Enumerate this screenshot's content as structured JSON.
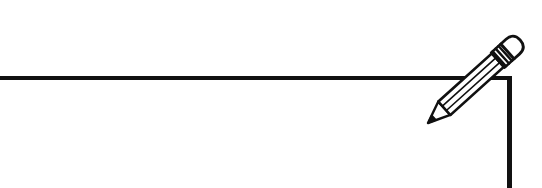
{
  "canvas": {
    "width": 542,
    "height": 188,
    "background": "#ffffff"
  },
  "frame": {
    "stroke_color": "#111111",
    "top_border_px": 4,
    "right_border_px": 5
  },
  "icons": {
    "pencil": "pencil-icon"
  }
}
